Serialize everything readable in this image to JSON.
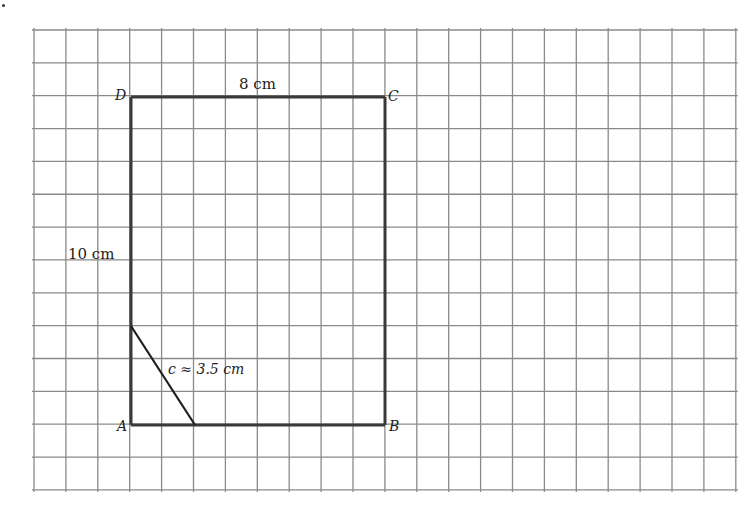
{
  "diagram": {
    "grid": {
      "x0": 34,
      "y0": 30,
      "cols": 22,
      "rows": 14,
      "cell_w": 31.9,
      "cell_h": 32.85,
      "line_color": "#8a8a8a"
    },
    "rectangle": {
      "stroke_color": "#3a3a3a",
      "vertices": {
        "A": {
          "label": "A",
          "x": 131,
          "y": 425
        },
        "B": {
          "label": "B",
          "x": 385,
          "y": 425
        },
        "C": {
          "label": "C",
          "x": 385,
          "y": 97
        },
        "D": {
          "label": "D",
          "x": 131,
          "y": 97
        }
      }
    },
    "segment_c": {
      "x1": 131,
      "y1": 326,
      "x2": 195,
      "y2": 425
    },
    "labels": {
      "top_side": "8 cm",
      "left_side": "10 cm",
      "hypotenuse": "c ≈ 3.5 cm"
    }
  }
}
